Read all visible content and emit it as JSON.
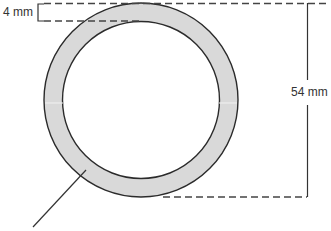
{
  "diagram": {
    "type": "ring cross-section",
    "labels": {
      "thickness": "4 mm",
      "diameter": "54 mm"
    },
    "colors": {
      "ring_fill": "#d9d9d9",
      "stroke": "#2b2b2b",
      "dash": "#444444",
      "text": "#333333"
    },
    "ring": {
      "outer_diameter_mm": 54,
      "thickness_mm": 4
    }
  }
}
